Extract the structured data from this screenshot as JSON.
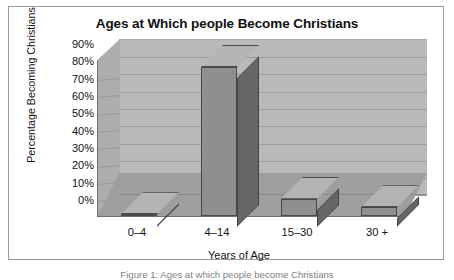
{
  "figure": {
    "caption": "Figure 1: Ages at which people become Christians"
  },
  "chart_data": {
    "type": "bar",
    "title": "Ages at Which people Become Christians",
    "xlabel": "Years of Age",
    "ylabel": "Percentage Becoming Christians",
    "categories": [
      "0–4",
      "4–14",
      "15–30",
      "30 +"
    ],
    "values": [
      1,
      86,
      10,
      5
    ],
    "value_labels": [
      "1%",
      "86%",
      "10%",
      "5%"
    ],
    "ylim": [
      0,
      90
    ],
    "ytick_labels": [
      "90%",
      "80%",
      "70%",
      "60%",
      "50%",
      "40%",
      "30%",
      "20%",
      "10%",
      "0%"
    ],
    "ytick_values": [
      90,
      80,
      70,
      60,
      50,
      40,
      30,
      20,
      10,
      0
    ],
    "grid": true,
    "legend": null,
    "style": "3d-column-grayscale",
    "colors": {
      "bar_front": "#8f8f8f",
      "bar_top": "#b4b4b4",
      "bar_side": "#666666",
      "bar_outline": "#4a4a4a",
      "back_wall": "#b9b9b9",
      "left_wall": "#adadad",
      "floor": "#9e9e9e",
      "gridline": "#9d9d9d",
      "frame_border": "#9a9a9a",
      "background": "#ffffff",
      "text": "#121212"
    }
  }
}
